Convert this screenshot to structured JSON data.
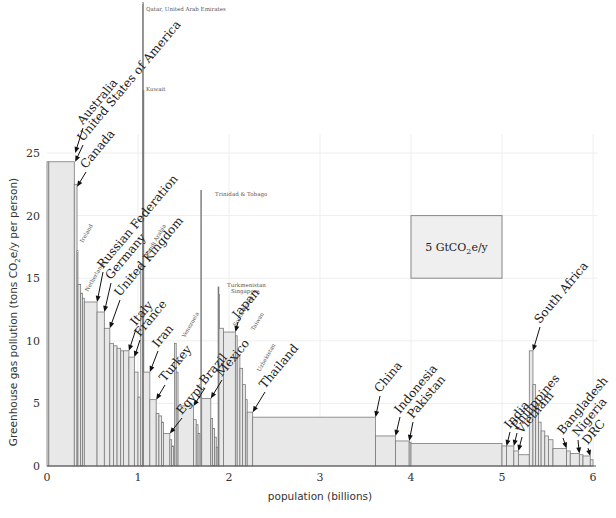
{
  "chart_data": {
    "type": "bar",
    "subtype": "variable-width (Marimekko) bar chart",
    "title": "",
    "xlabel": "population (billions)",
    "ylabel": "Greenhouse gas pollution (tons CO2e/y per person)",
    "ylabel_parts": {
      "pre": "Greenhouse gas pollution (tons CO",
      "sub": "2",
      "post": "e/y per person)"
    },
    "xlim": [
      0,
      6.05
    ],
    "ylim": [
      0,
      25
    ],
    "xticks": [
      0,
      1,
      2,
      3,
      4,
      5,
      6
    ],
    "yticks": [
      0,
      5,
      10,
      15,
      20,
      25
    ],
    "grid": true,
    "legend": {
      "label_pre": "5 GtCO",
      "label_sub": "2",
      "label_post": "e/y",
      "area_GtCO2e_per_y": 5,
      "box": {
        "x0": 4.0,
        "x1": 5.0,
        "y0": 15.0,
        "y1": 20.0
      }
    },
    "bars": [
      {
        "country": "Australia",
        "x0": 0.0,
        "width": 0.02,
        "value": 24.3
      },
      {
        "country": "United States of America",
        "x0": 0.02,
        "width": 0.28,
        "value": 24.3
      },
      {
        "country": "Canada",
        "x0": 0.3,
        "width": 0.03,
        "value": 22.5
      },
      {
        "country": "Ireland",
        "x0": 0.33,
        "width": 0.01,
        "value": 17.2
      },
      {
        "country": "",
        "x0": 0.34,
        "width": 0.03,
        "value": 14.5
      },
      {
        "country": "",
        "x0": 0.37,
        "width": 0.02,
        "value": 13.8
      },
      {
        "country": "Netherlands",
        "x0": 0.39,
        "width": 0.02,
        "value": 13.4
      },
      {
        "country": "Russian Federation",
        "x0": 0.41,
        "width": 0.14,
        "value": 13.1
      },
      {
        "country": "Germany",
        "x0": 0.55,
        "width": 0.08,
        "value": 12.3
      },
      {
        "country": "United Kingdom",
        "x0": 0.63,
        "width": 0.06,
        "value": 11.0
      },
      {
        "country": "",
        "x0": 0.69,
        "width": 0.04,
        "value": 9.8
      },
      {
        "country": "",
        "x0": 0.73,
        "width": 0.04,
        "value": 9.6
      },
      {
        "country": "",
        "x0": 0.77,
        "width": 0.04,
        "value": 9.4
      },
      {
        "country": "",
        "x0": 0.81,
        "width": 0.03,
        "value": 9.2
      },
      {
        "country": "Italy",
        "x0": 0.84,
        "width": 0.06,
        "value": 9.2
      },
      {
        "country": "France",
        "x0": 0.9,
        "width": 0.06,
        "value": 8.7
      },
      {
        "country": "",
        "x0": 0.96,
        "width": 0.04,
        "value": 7.5
      },
      {
        "country": "",
        "x0": 1.0,
        "width": 0.03,
        "value": 5.5
      },
      {
        "country": "Saudi Arabia",
        "x0": 1.03,
        "width": 0.02,
        "value": 16.0
      },
      {
        "country": "Qatar, United Arab Emirates",
        "x0": 1.05,
        "width": 0.005,
        "value": 37.0
      },
      {
        "country": "Kuwait",
        "x0": 1.055,
        "width": 0.005,
        "value": 30.0
      },
      {
        "country": "Iran",
        "x0": 1.06,
        "width": 0.07,
        "value": 7.5
      },
      {
        "country": "Turkey",
        "x0": 1.13,
        "width": 0.07,
        "value": 5.3
      },
      {
        "country": "",
        "x0": 1.2,
        "width": 0.03,
        "value": 4.2
      },
      {
        "country": "",
        "x0": 1.23,
        "width": 0.03,
        "value": 4.0
      },
      {
        "country": "",
        "x0": 1.26,
        "width": 0.02,
        "value": 3.5
      },
      {
        "country": "Egypt",
        "x0": 1.28,
        "width": 0.07,
        "value": 2.6
      },
      {
        "country": "",
        "x0": 1.35,
        "width": 0.02,
        "value": 2.1
      },
      {
        "country": "",
        "x0": 1.37,
        "width": 0.02,
        "value": 1.6
      },
      {
        "country": "Venezuela",
        "x0": 1.4,
        "width": 0.02,
        "value": 9.8
      },
      {
        "country": "",
        "x0": 1.42,
        "width": 0.02,
        "value": 7.5
      },
      {
        "country": "Brazil",
        "x0": 1.44,
        "width": 0.17,
        "value": 4.8
      },
      {
        "country": "",
        "x0": 1.61,
        "width": 0.03,
        "value": 3.7
      },
      {
        "country": "",
        "x0": 1.64,
        "width": 0.02,
        "value": 3.3
      },
      {
        "country": "",
        "x0": 1.66,
        "width": 0.02,
        "value": 2.6
      },
      {
        "country": "Trinidad & Tobago",
        "x0": 1.69,
        "width": 0.004,
        "value": 22.0
      },
      {
        "country": "Mexico",
        "x0": 1.7,
        "width": 0.1,
        "value": 5.4
      },
      {
        "country": "",
        "x0": 1.8,
        "width": 0.02,
        "value": 3.8
      },
      {
        "country": "",
        "x0": 1.82,
        "width": 0.02,
        "value": 3.0
      },
      {
        "country": "",
        "x0": 1.84,
        "width": 0.02,
        "value": 2.3
      },
      {
        "country": "",
        "x0": 1.86,
        "width": 0.02,
        "value": 1.5
      },
      {
        "country": "Turkmenistan",
        "x0": 1.88,
        "width": 0.005,
        "value": 14.3
      },
      {
        "country": "Singapore",
        "x0": 1.885,
        "width": 0.005,
        "value": 13.7
      },
      {
        "country": "South Korea",
        "x0": 1.89,
        "width": 0.05,
        "value": 11.0
      },
      {
        "country": "Japan",
        "x0": 1.94,
        "width": 0.13,
        "value": 10.7
      },
      {
        "country": "Taiwan",
        "x0": 2.07,
        "width": 0.02,
        "value": 10.4
      },
      {
        "country": "",
        "x0": 2.09,
        "width": 0.03,
        "value": 8.8
      },
      {
        "country": "",
        "x0": 2.12,
        "width": 0.03,
        "value": 7.8
      },
      {
        "country": "Uzbekistan",
        "x0": 2.15,
        "width": 0.03,
        "value": 6.5
      },
      {
        "country": "",
        "x0": 2.18,
        "width": 0.02,
        "value": 5.3
      },
      {
        "country": "Thailand",
        "x0": 2.2,
        "width": 0.06,
        "value": 4.3
      },
      {
        "country": "China",
        "x0": 2.26,
        "width": 1.35,
        "value": 3.9
      },
      {
        "country": "Indonesia",
        "x0": 3.61,
        "width": 0.22,
        "value": 2.4
      },
      {
        "country": "Pakistan",
        "x0": 3.83,
        "width": 0.15,
        "value": 2.0
      },
      {
        "country": "",
        "x0": 3.98,
        "width": 0.02,
        "value": 1.9
      },
      {
        "country": "",
        "x0": 4.0,
        "width": 1.0,
        "value": 1.8
      },
      {
        "country": "India",
        "x0": 5.0,
        "width": 0.05,
        "value": 1.6
      },
      {
        "country": "Philippines",
        "x0": 5.05,
        "width": 0.08,
        "value": 1.6
      },
      {
        "country": "Vietnam",
        "x0": 5.13,
        "width": 0.05,
        "value": 1.2
      },
      {
        "country": "",
        "x0": 5.18,
        "width": 0.12,
        "value": 0.9
      },
      {
        "country": "South Africa",
        "x0": 5.3,
        "width": 0.04,
        "value": 9.2
      },
      {
        "country": "",
        "x0": 5.34,
        "width": 0.03,
        "value": 6.5
      },
      {
        "country": "",
        "x0": 5.37,
        "width": 0.03,
        "value": 5.0
      },
      {
        "country": "",
        "x0": 5.4,
        "width": 0.03,
        "value": 3.5
      },
      {
        "country": "",
        "x0": 5.43,
        "width": 0.04,
        "value": 2.8
      },
      {
        "country": "",
        "x0": 5.47,
        "width": 0.04,
        "value": 2.4
      },
      {
        "country": "",
        "x0": 5.51,
        "width": 0.05,
        "value": 2.1
      },
      {
        "country": "Bangladesh",
        "x0": 5.56,
        "width": 0.15,
        "value": 1.4
      },
      {
        "country": "",
        "x0": 5.71,
        "width": 0.04,
        "value": 1.2
      },
      {
        "country": "Nigeria",
        "x0": 5.75,
        "width": 0.1,
        "value": 1.0
      },
      {
        "country": "",
        "x0": 5.85,
        "width": 0.04,
        "value": 0.9
      },
      {
        "country": "DRC",
        "x0": 5.89,
        "width": 0.08,
        "value": 0.8
      },
      {
        "country": "",
        "x0": 5.97,
        "width": 0.03,
        "value": 0.5
      }
    ],
    "big_labels": [
      {
        "text": "Australia",
        "x": 0.31,
        "y": 25.0,
        "tx": 83,
        "ty": 128,
        "len": 78
      },
      {
        "text": "United States of America",
        "x": 0.31,
        "y": 24.3,
        "tx": 83,
        "ty": 145,
        "len": 190
      },
      {
        "text": "Canada",
        "x": 0.33,
        "y": 22.3,
        "tx": 86,
        "ty": 172,
        "len": 60
      },
      {
        "text": "Russian Federation",
        "x": 0.55,
        "y": 13.1,
        "tx": 103,
        "ty": 272,
        "len": 148
      },
      {
        "text": "Germany",
        "x": 0.63,
        "y": 12.3,
        "tx": 111,
        "ty": 283,
        "len": 72
      },
      {
        "text": "United Kingdom",
        "x": 0.69,
        "y": 11.0,
        "tx": 120,
        "ty": 300,
        "len": 120
      },
      {
        "text": "Italy",
        "x": 0.9,
        "y": 9.2,
        "tx": 136,
        "ty": 329,
        "len": 38
      },
      {
        "text": "France",
        "x": 0.96,
        "y": 8.7,
        "tx": 140,
        "ty": 340,
        "len": 54
      },
      {
        "text": "Iran",
        "x": 1.13,
        "y": 7.5,
        "tx": 158,
        "ty": 351,
        "len": 34
      },
      {
        "text": "Turkey",
        "x": 1.2,
        "y": 5.3,
        "tx": 165,
        "ty": 385,
        "len": 54
      },
      {
        "text": "Egypt",
        "x": 1.35,
        "y": 2.6,
        "tx": 182,
        "ty": 418,
        "len": 44
      },
      {
        "text": "Brazil",
        "x": 1.61,
        "y": 4.8,
        "tx": 205,
        "ty": 388,
        "len": 48
      },
      {
        "text": "Mexico",
        "x": 1.8,
        "y": 5.4,
        "tx": 222,
        "ty": 380,
        "len": 56
      },
      {
        "text": "Japan",
        "x": 2.07,
        "y": 10.7,
        "tx": 238,
        "ty": 322,
        "len": 48
      },
      {
        "text": "Thailand",
        "x": 2.26,
        "y": 4.3,
        "tx": 265,
        "ty": 392,
        "len": 74
      },
      {
        "text": "China",
        "x": 3.61,
        "y": 3.9,
        "tx": 380,
        "ty": 396,
        "len": 46
      },
      {
        "text": "Indonesia",
        "x": 3.83,
        "y": 2.4,
        "tx": 400,
        "ty": 417,
        "len": 78
      },
      {
        "text": "Pakistan",
        "x": 3.98,
        "y": 2.0,
        "tx": 413,
        "ty": 422,
        "len": 66
      },
      {
        "text": "India",
        "x": 5.05,
        "y": 1.6,
        "tx": 510,
        "ty": 432,
        "len": 40
      },
      {
        "text": "Philippines",
        "x": 5.13,
        "y": 1.6,
        "tx": 517,
        "ty": 433,
        "len": 80
      },
      {
        "text": "Vietnam",
        "x": 5.18,
        "y": 1.2,
        "tx": 522,
        "ty": 437,
        "len": 58
      },
      {
        "text": "South Africa",
        "x": 5.34,
        "y": 9.2,
        "tx": 540,
        "ty": 327,
        "len": 96
      },
      {
        "text": "Bangladesh",
        "x": 5.71,
        "y": 1.4,
        "tx": 563,
        "ty": 438,
        "len": 82
      },
      {
        "text": "Nigeria",
        "x": 5.85,
        "y": 1.0,
        "tx": 578,
        "ty": 440,
        "len": 56
      },
      {
        "text": "DRC",
        "x": 5.97,
        "y": 0.8,
        "tx": 588,
        "ty": 448,
        "len": 32
      }
    ],
    "small_labels": [
      {
        "text": "Qatar, United Arab Emirates",
        "px": 146,
        "py": 11,
        "rot": 0
      },
      {
        "text": "Kuwait",
        "px": 146,
        "py": 91,
        "rot": 0
      },
      {
        "text": "Trinidad & Tobago",
        "px": 215,
        "py": 196,
        "rot": 0
      },
      {
        "text": "Turkmenistan",
        "px": 227,
        "py": 287,
        "rot": 0
      },
      {
        "text": "Singapore",
        "px": 231,
        "py": 293,
        "rot": 0
      },
      {
        "text": "Ireland",
        "px": 83,
        "py": 243,
        "rot": -60
      },
      {
        "text": "Netherlands",
        "px": 88,
        "py": 292,
        "rot": -60
      },
      {
        "text": "Saudi Arabia",
        "px": 148,
        "py": 257,
        "rot": -60
      },
      {
        "text": "Venezuela",
        "px": 185,
        "py": 338,
        "rot": -60
      },
      {
        "text": "South Korea",
        "px": 236,
        "py": 327,
        "rot": -60
      },
      {
        "text": "Taiwan",
        "px": 254,
        "py": 331,
        "rot": -60
      },
      {
        "text": "Uzbekistan",
        "px": 260,
        "py": 372,
        "rot": -60
      }
    ]
  }
}
